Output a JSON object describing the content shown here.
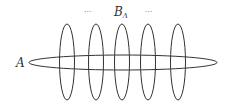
{
  "diagram": {
    "label_a": "A",
    "label_b": "B",
    "label_b_sub": "Λ",
    "dots_left": "···",
    "dots_right": "···",
    "stroke_color": "#333333",
    "vertical_ellipses": [
      {
        "cx": 67,
        "cy": 62,
        "rx": 7.5,
        "ry": 38
      },
      {
        "cx": 96,
        "cy": 62,
        "rx": 7.5,
        "ry": 38
      },
      {
        "cx": 122,
        "cy": 62,
        "rx": 7.5,
        "ry": 38
      },
      {
        "cx": 148,
        "cy": 62,
        "rx": 7.5,
        "ry": 38
      },
      {
        "cx": 178,
        "cy": 62,
        "rx": 7.5,
        "ry": 38
      }
    ],
    "horizontal_ellipse": {
      "cx": 123,
      "cy": 62.5,
      "rx": 94,
      "ry": 7.5
    }
  }
}
